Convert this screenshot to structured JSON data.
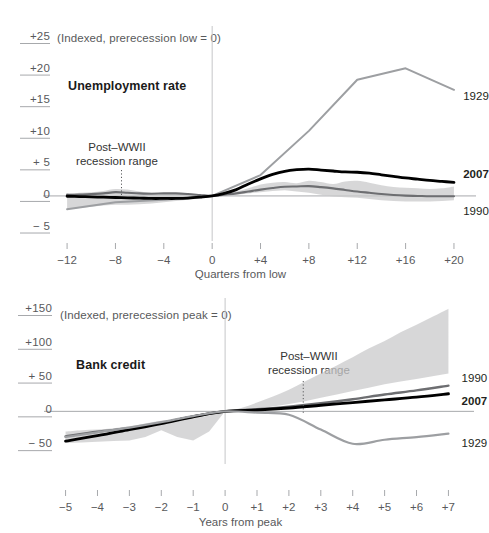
{
  "figure": {
    "background": "#ffffff",
    "colors": {
      "band": "#c9cacb",
      "series_1929": "#9d9fa2",
      "series_1990": "#6d6e71",
      "series_2007": "#000000",
      "axis": "#a7a9ac",
      "text": "#58595b"
    }
  },
  "chart_data": [
    {
      "id": "unemployment",
      "type": "line",
      "title": "Unemployment rate",
      "subtitle": "(Indexed, prerecession low = 0)",
      "xlabel": "Quarters from low",
      "ylabel": "",
      "xlim": [
        -13,
        20.5
      ],
      "ylim": [
        -6.5,
        25
      ],
      "ytick_labels": [
        "+25",
        "+20",
        "+15",
        "+10",
        "+ 5",
        "0",
        "− 5"
      ],
      "ytick_values": [
        25,
        20,
        15,
        10,
        5,
        0,
        -5
      ],
      "xtick_labels": [
        "−12",
        "−8",
        "−4",
        "0",
        "+4",
        "+8",
        "+12",
        "+16",
        "+20"
      ],
      "xtick_values": [
        -12,
        -8,
        -4,
        0,
        4,
        8,
        12,
        16,
        20
      ],
      "grid": false,
      "zero_line": 0,
      "annotation": {
        "text_line1": "Post–WWII",
        "text_line2": "recession range",
        "target_x": -7.5
      },
      "band": {
        "name": "Post-WWII recession range",
        "x": [
          -12,
          -11,
          -10,
          -9,
          -8,
          -7,
          -6,
          -5,
          -4,
          -3,
          -2,
          -1,
          0,
          1,
          2,
          3,
          4,
          5,
          6,
          7,
          8,
          9,
          10,
          11,
          12,
          13,
          14,
          15,
          16,
          17,
          18,
          19,
          20
        ],
        "upper": [
          0.3,
          0.5,
          0.6,
          0.8,
          1.1,
          1.0,
          0.7,
          0.5,
          0.4,
          0.3,
          0.2,
          0.1,
          0.0,
          0.3,
          0.7,
          1.2,
          1.8,
          2.1,
          2.2,
          2.0,
          2.4,
          2.2,
          1.9,
          2.3,
          2.4,
          2.1,
          1.7,
          1.4,
          1.3,
          1.2,
          1.1,
          1.2,
          1.5
        ],
        "lower": [
          -2.1,
          -1.9,
          -1.7,
          -1.5,
          -1.4,
          -1.4,
          -1.3,
          -1.2,
          -1.0,
          -0.8,
          -0.6,
          -0.4,
          0.0,
          0.1,
          0.2,
          0.4,
          0.6,
          0.8,
          0.9,
          0.7,
          0.5,
          0.2,
          -0.1,
          -0.2,
          -0.3,
          -0.5,
          -0.7,
          -0.8,
          -0.9,
          -0.9,
          -0.9,
          -0.8,
          -0.7
        ]
      },
      "series": [
        {
          "name": "1929",
          "color": "#9d9fa2",
          "width": 2.0,
          "label_x": 20.6,
          "label_y": 15.6,
          "x": [
            -12,
            -8,
            -4,
            0,
            4,
            8,
            12,
            16,
            20
          ],
          "values": [
            -2.1,
            -1.0,
            -0.6,
            0.0,
            3.3,
            10.3,
            18.4,
            20.2,
            16.8
          ]
        },
        {
          "name": "1990",
          "color": "#6d6e71",
          "width": 2.1,
          "label_x": 20.6,
          "label_y": -2.6,
          "x": [
            -12,
            -11,
            -10,
            -9,
            -8,
            -7,
            -6,
            -5,
            -4,
            -3,
            -2,
            -1,
            0,
            1,
            2,
            3,
            4,
            5,
            6,
            7,
            8,
            9,
            10,
            11,
            12,
            13,
            14,
            15,
            16,
            17,
            18,
            19,
            20
          ],
          "values": [
            0.2,
            0.2,
            0.3,
            0.4,
            0.6,
            0.5,
            0.4,
            0.35,
            0.4,
            0.4,
            0.3,
            0.15,
            0.0,
            0.2,
            0.4,
            0.7,
            1.0,
            1.25,
            1.45,
            1.5,
            1.55,
            1.4,
            1.2,
            0.95,
            0.7,
            0.5,
            0.3,
            0.15,
            0.05,
            0.0,
            -0.05,
            -0.05,
            -0.05
          ]
        },
        {
          "name": "2007",
          "color": "#000000",
          "width": 2.8,
          "label_x": 20.6,
          "label_y": 3.3,
          "bold": true,
          "x": [
            -12,
            -11,
            -10,
            -9,
            -8,
            -7,
            -6,
            -5,
            -4,
            -3,
            -2,
            -1,
            0,
            1,
            2,
            3,
            4,
            5,
            6,
            7,
            8,
            9,
            10,
            11,
            12,
            13,
            14,
            15,
            16,
            17,
            18,
            19,
            20
          ],
          "values": [
            -0.05,
            -0.1,
            -0.15,
            -0.2,
            -0.25,
            -0.3,
            -0.35,
            -0.4,
            -0.4,
            -0.4,
            -0.35,
            -0.2,
            0.0,
            0.4,
            1.0,
            1.9,
            2.7,
            3.4,
            3.9,
            4.15,
            4.25,
            4.1,
            3.95,
            3.8,
            3.75,
            3.6,
            3.35,
            3.1,
            2.85,
            2.65,
            2.45,
            2.3,
            2.15
          ]
        }
      ]
    },
    {
      "id": "bankcredit",
      "type": "line",
      "title": "Bank credit",
      "subtitle": "(Indexed, prerecession peak = 0)",
      "xlabel": "Years from peak",
      "ylabel": "",
      "xlim": [
        -5.3,
        7.3
      ],
      "ylim": [
        -72,
        150
      ],
      "ytick_labels": [
        "+150",
        "+100",
        "+ 50",
        "0",
        "− 50"
      ],
      "ytick_values": [
        150,
        100,
        50,
        0,
        -50
      ],
      "xtick_labels": [
        "−5",
        "−4",
        "−3",
        "−2",
        "−1",
        "0",
        "+1",
        "+2",
        "+3",
        "+4",
        "+5",
        "+6",
        "+7"
      ],
      "xtick_values": [
        -5,
        -4,
        -3,
        -2,
        -1,
        0,
        1,
        2,
        3,
        4,
        5,
        6,
        7
      ],
      "grid": false,
      "zero_line": 0,
      "annotation": {
        "text_line1": "Post–WWII",
        "text_line2": "recession range",
        "target_x": 2.45
      },
      "band": {
        "name": "Post-WWII recession range",
        "x": [
          -5,
          -4.5,
          -4,
          -3.5,
          -3,
          -2.5,
          -2,
          -1.5,
          -1,
          -0.5,
          0,
          0.5,
          1,
          1.5,
          2,
          2.5,
          3,
          3.5,
          4,
          4.5,
          5,
          5.5,
          6,
          6.5,
          7
        ],
        "upper": [
          -30,
          -28,
          -27,
          -25,
          -22,
          -18,
          -14,
          -13,
          -10,
          -6,
          0,
          5,
          13,
          22,
          32,
          44,
          56,
          68,
          80,
          93,
          104,
          117,
          128,
          140,
          152
        ],
        "lower": [
          -47,
          -46,
          -45,
          -44,
          -43,
          -38,
          -28,
          -38,
          -43,
          -30,
          0,
          2,
          4,
          7,
          11,
          15,
          20,
          25,
          30,
          35,
          40,
          44,
          48,
          52,
          56
        ]
      },
      "series": [
        {
          "name": "1990",
          "color": "#6d6e71",
          "width": 2.4,
          "label_x": 7.35,
          "label_y": 48,
          "x": [
            -5,
            -4,
            -3,
            -2,
            -1,
            0,
            1,
            2,
            3,
            4,
            5,
            6,
            7
          ],
          "values": [
            -37,
            -30,
            -25,
            -17,
            -8,
            0,
            3,
            7,
            12,
            18,
            25,
            31,
            38
          ]
        },
        {
          "name": "2007",
          "color": "#000000",
          "width": 2.9,
          "label_x": 7.35,
          "label_y": 14,
          "bold": true,
          "x": [
            -5,
            -4,
            -3,
            -2,
            -1,
            0,
            1,
            2,
            3,
            4,
            5,
            6,
            7
          ],
          "values": [
            -44,
            -36,
            -27,
            -18,
            -8,
            0,
            2,
            5,
            9,
            13,
            17,
            21,
            26
          ]
        },
        {
          "name": "1929",
          "color": "#9d9fa2",
          "width": 2.2,
          "label_x": 7.35,
          "label_y": -49,
          "x": [
            -5,
            -4,
            -3,
            -2,
            -1,
            0,
            1,
            2,
            3,
            4,
            5,
            6,
            7
          ],
          "values": [
            -38,
            -31,
            -24,
            -16,
            -7,
            0,
            -2,
            -5,
            -27,
            -48,
            -42,
            -38,
            -33
          ]
        }
      ]
    }
  ]
}
